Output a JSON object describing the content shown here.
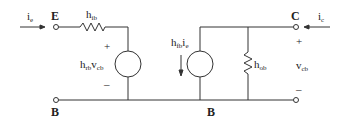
{
  "diagram": {
    "type": "h-parameter common-base transistor equivalent circuit",
    "terminals": {
      "emitter": "E",
      "collector": "C",
      "base_left": "B",
      "base_mid": "B"
    },
    "currents": {
      "input": {
        "base": "i",
        "sub": "e"
      },
      "output": {
        "base": "i",
        "sub": "c"
      }
    },
    "components": {
      "input_resistor": {
        "base": "h",
        "sub": "ib"
      },
      "voltage_source": {
        "base": "h",
        "sub1": "rb",
        "mid": "v",
        "sub2": "cb"
      },
      "current_source": {
        "base": "h",
        "sub1": "fb",
        "mid": "i",
        "sub2": "e"
      },
      "output_resistor": {
        "base": "h",
        "sub": "ob"
      }
    },
    "output_voltage": {
      "base": "v",
      "sub": "cb"
    },
    "polarity": {
      "plus": "+",
      "minus": "–"
    },
    "colors": {
      "line": "#333333",
      "text": "#222222",
      "background": "#ffffff"
    }
  }
}
